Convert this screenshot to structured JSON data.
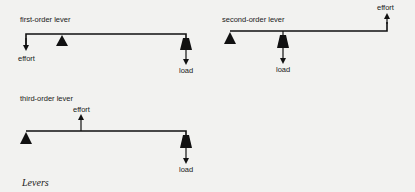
{
  "diagram": {
    "caption": "Levers",
    "levers": [
      {
        "id": "first-order",
        "title": "first-order lever",
        "effort_label": "effort",
        "load_label": "load",
        "effort_direction": "down",
        "load_direction": "down"
      },
      {
        "id": "second-order",
        "title": "second-order lever",
        "effort_label": "effort",
        "load_label": "load",
        "effort_direction": "up",
        "load_direction": "down"
      },
      {
        "id": "third-order",
        "title": "third-order lever",
        "effort_label": "effort",
        "load_label": "load",
        "effort_direction": "up",
        "load_direction": "down"
      }
    ],
    "colors": {
      "background": "#f2f2f0",
      "ink": "#111111"
    }
  }
}
